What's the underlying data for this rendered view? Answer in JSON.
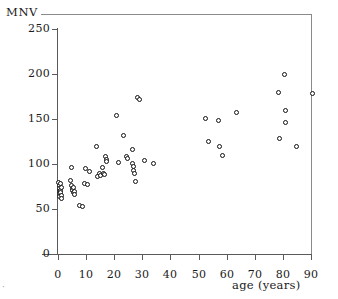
{
  "axis_title_y": "MNV",
  "axis_title_x": "age (years)",
  "corner_mark": "·",
  "yticks": [
    "0",
    "50",
    "100",
    "150",
    "200",
    "250"
  ],
  "xticks": [
    "0",
    "10",
    "20",
    "30",
    "40",
    "50",
    "60",
    "70",
    "80",
    "90"
  ],
  "colors": {
    "marker_edge": "#111111",
    "marker_fill": "#ffffff",
    "axis": "#5a5a5a",
    "border": "#8a8a8a",
    "background": "#ffffff"
  },
  "chart_data": {
    "type": "scatter",
    "title": "",
    "xlabel": "age (years)",
    "ylabel": "MNV",
    "xlim": [
      -5,
      95
    ],
    "ylim": [
      0,
      250
    ],
    "xticks": [
      0,
      10,
      20,
      30,
      40,
      50,
      60,
      70,
      80,
      90
    ],
    "yticks": [
      0,
      50,
      100,
      150,
      200,
      250
    ],
    "grid": false,
    "legend": false,
    "marker": "open-circle",
    "n_points": 62,
    "series": [
      {
        "name": "MNV vs age",
        "points": [
          [
            0.3,
            80
          ],
          [
            0.4,
            76
          ],
          [
            0.5,
            73
          ],
          [
            0.5,
            70
          ],
          [
            0.6,
            67
          ],
          [
            0.7,
            64
          ],
          [
            0.8,
            71
          ],
          [
            0.9,
            68
          ],
          [
            1.0,
            78
          ],
          [
            1.1,
            74
          ],
          [
            1.2,
            65
          ],
          [
            1.3,
            62
          ],
          [
            4.6,
            82
          ],
          [
            4.8,
            76
          ],
          [
            5.0,
            73
          ],
          [
            5.2,
            71
          ],
          [
            5.4,
            68
          ],
          [
            5.6,
            74
          ],
          [
            5.8,
            70
          ],
          [
            6.0,
            66
          ],
          [
            4.9,
            96
          ],
          [
            7.6,
            54
          ],
          [
            8.6,
            53
          ],
          [
            9.5,
            78
          ],
          [
            9.9,
            95
          ],
          [
            10.4,
            77
          ],
          [
            11.2,
            92
          ],
          [
            13.6,
            120
          ],
          [
            14.2,
            86
          ],
          [
            14.6,
            89
          ],
          [
            15.0,
            87
          ],
          [
            16.0,
            96
          ],
          [
            16.3,
            90
          ],
          [
            16.6,
            88
          ],
          [
            17.0,
            108
          ],
          [
            17.2,
            105
          ],
          [
            17.4,
            103
          ],
          [
            20.8,
            154
          ],
          [
            21.6,
            102
          ],
          [
            23.4,
            132
          ],
          [
            24.4,
            108
          ],
          [
            24.8,
            106
          ],
          [
            26.4,
            116
          ],
          [
            26.6,
            101
          ],
          [
            26.8,
            97
          ],
          [
            27.0,
            93
          ],
          [
            27.2,
            90
          ],
          [
            27.4,
            81
          ],
          [
            28.4,
            174
          ],
          [
            29.0,
            172
          ],
          [
            30.8,
            104
          ],
          [
            34.0,
            101
          ],
          [
            52.6,
            151
          ],
          [
            53.4,
            125
          ],
          [
            57.0,
            148
          ],
          [
            57.6,
            120
          ],
          [
            58.4,
            109
          ],
          [
            63.4,
            157
          ],
          [
            78.6,
            180
          ],
          [
            78.8,
            128
          ],
          [
            80.4,
            199
          ],
          [
            80.8,
            159
          ],
          [
            81.0,
            146
          ],
          [
            85.0,
            119
          ],
          [
            90.4,
            178
          ]
        ]
      }
    ]
  }
}
